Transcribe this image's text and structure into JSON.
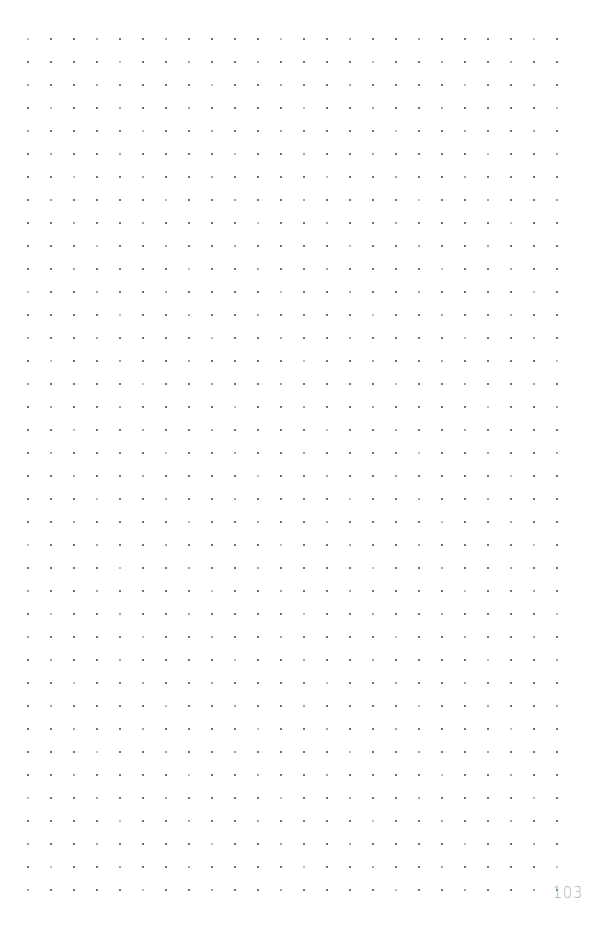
{
  "page": {
    "kind": "dot-grid-notebook-page",
    "width": 597,
    "height": 952,
    "background_color": "#ffffff",
    "page_number": "103"
  },
  "grid": {
    "columns": 24,
    "rows": 38,
    "spacing_px": 23,
    "origin_x": 27,
    "origin_y": 38,
    "dot_size_px": 2,
    "dot_color": "#62626e",
    "margins": {
      "left": 27,
      "top": 38,
      "right": 35,
      "bottom": 49
    }
  },
  "footer": {
    "page_number_label": "103",
    "page_number_color": "#b2b2b6"
  }
}
